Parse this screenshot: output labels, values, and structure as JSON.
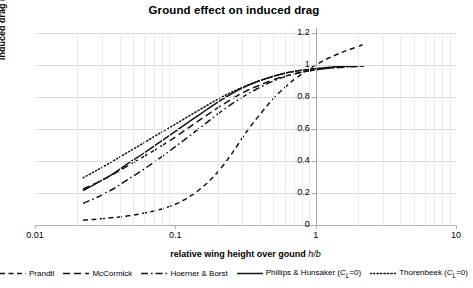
{
  "chart_data": {
    "type": "line",
    "title": "Ground effect on induced drag",
    "xlabel": "relative wing height over gound h/b",
    "xlabel_plain": "relative wing height over gound",
    "xlabel_italic": "h/b",
    "ylabel": "induced drag ratio C_Di/C_Di∞",
    "ylabel_plain": "induced drag ratio",
    "xscale": "log",
    "xlim": [
      0.01,
      10
    ],
    "ylim": [
      0,
      1.2
    ],
    "xticks": [
      "0.01",
      "0.1",
      "1",
      "10"
    ],
    "xtick_values": [
      0.01,
      0.1,
      1,
      10
    ],
    "yticks": [
      "0",
      "0.2",
      "0.4",
      "0.6",
      "0.8",
      "1",
      "1.2"
    ],
    "ytick_values": [
      0,
      0.2,
      0.4,
      0.6,
      0.8,
      1,
      1.2
    ],
    "grid": "horizontal",
    "legend_position": "bottom",
    "yaxis_position": "at x = 1",
    "series": [
      {
        "name": "Prandtl",
        "style": "dashed",
        "x": [
          0.022,
          0.026,
          0.032,
          0.04,
          0.05,
          0.063,
          0.08,
          0.1,
          0.125,
          0.16,
          0.2,
          0.25,
          0.32,
          0.4,
          0.5,
          0.63,
          0.8,
          1.0,
          1.25,
          1.6,
          2.0,
          2.2
        ],
        "y": [
          0.03,
          0.035,
          0.042,
          0.05,
          0.062,
          0.078,
          0.1,
          0.13,
          0.175,
          0.245,
          0.33,
          0.44,
          0.58,
          0.69,
          0.79,
          0.875,
          0.945,
          1.0,
          1.045,
          1.085,
          1.115,
          1.13
        ]
      },
      {
        "name": "McCormick",
        "style": "long-dashed",
        "x": [
          0.022,
          0.03,
          0.04,
          0.055,
          0.075,
          0.1,
          0.13,
          0.17,
          0.22,
          0.3,
          0.4,
          0.55,
          0.75,
          1.0,
          1.4,
          1.8,
          2.2
        ],
        "y": [
          0.225,
          0.28,
          0.34,
          0.41,
          0.48,
          0.55,
          0.62,
          0.69,
          0.755,
          0.825,
          0.875,
          0.92,
          0.95,
          0.97,
          0.985,
          0.99,
          0.995
        ]
      },
      {
        "name": "Hoerner & Borst",
        "style": "dash-dot",
        "x": [
          0.022,
          0.028,
          0.036,
          0.046,
          0.06,
          0.078,
          0.1,
          0.13,
          0.17,
          0.22,
          0.29,
          0.38,
          0.5,
          0.65,
          0.85,
          1.1,
          1.5,
          1.9,
          2.2
        ],
        "y": [
          0.135,
          0.175,
          0.225,
          0.285,
          0.35,
          0.42,
          0.49,
          0.565,
          0.645,
          0.72,
          0.79,
          0.85,
          0.9,
          0.935,
          0.96,
          0.975,
          0.985,
          0.99,
          0.995
        ]
      },
      {
        "name": "Phillips & Hunsaker (CL=0)",
        "label_plain": "Phillips & Hunsaker (",
        "label_italic": "C",
        "label_sub": "L",
        "label_tail": "=0)",
        "style": "solid",
        "x": [
          0.022,
          0.028,
          0.036,
          0.046,
          0.06,
          0.078,
          0.1,
          0.13,
          0.17,
          0.22,
          0.29,
          0.38,
          0.5,
          0.65,
          0.85,
          1.1,
          1.5,
          1.9,
          2.2
        ],
        "y": [
          0.215,
          0.265,
          0.32,
          0.385,
          0.45,
          0.52,
          0.585,
          0.655,
          0.725,
          0.79,
          0.85,
          0.895,
          0.93,
          0.955,
          0.97,
          0.98,
          0.99,
          0.995,
          0.995
        ]
      },
      {
        "name": "Thorenbeek (CL=0)",
        "label_plain": "Thorenbeek (",
        "label_italic": "C",
        "label_sub": "L",
        "label_tail": "=0)",
        "style": "dotted",
        "x": [
          0.022,
          0.028,
          0.036,
          0.046,
          0.06,
          0.078,
          0.1,
          0.13,
          0.17,
          0.22,
          0.29,
          0.38,
          0.5,
          0.65,
          0.85,
          1.1,
          1.5,
          1.9,
          2.2
        ],
        "y": [
          0.295,
          0.345,
          0.4,
          0.455,
          0.515,
          0.575,
          0.63,
          0.69,
          0.75,
          0.805,
          0.855,
          0.895,
          0.93,
          0.955,
          0.97,
          0.98,
          0.99,
          0.995,
          0.995
        ]
      }
    ]
  },
  "legend": {
    "items": [
      {
        "label": "Prandtl"
      },
      {
        "label": "McCormick"
      },
      {
        "label": "Hoerner & Borst"
      },
      {
        "label": "Phillips & Hunsaker (",
        "tail": "=0)",
        "sub": "L",
        "var": "C"
      },
      {
        "label": "Thorenbeek (",
        "tail": "=0)",
        "sub": "L",
        "var": "C"
      }
    ]
  }
}
